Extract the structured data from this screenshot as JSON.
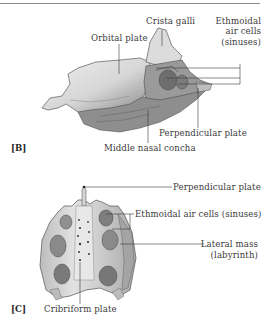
{
  "figure": {
    "panels": [
      {
        "tag": "[B]",
        "view": "lateral",
        "labels": {
          "crista_galli": "Crista galli",
          "orbital_plate": "Orbital plate",
          "ethmoidal_air_cells_1": "Ethmoidal",
          "ethmoidal_air_cells_2": "air cells",
          "ethmoidal_air_cells_3": "(sinuses)",
          "perpendicular_plate": "Perpendicular plate",
          "middle_nasal_concha": "Middle nasal concha"
        }
      },
      {
        "tag": "[C]",
        "view": "superior",
        "labels": {
          "perpendicular_plate": "Perpendicular plate",
          "ethmoidal_air_cells": "Ethmoidal air cells (sinuses)",
          "lateral_mass_1": "Lateral mass",
          "lateral_mass_2": "(labyrinth)",
          "cribriform_plate": "Cribriform plate"
        }
      }
    ],
    "colors": {
      "bone_light": "#e6e6e6",
      "bone_mid": "#b8b8b8",
      "bone_dark": "#6e6e6e",
      "leader_line": "#3a3a3a",
      "text": "#3c3c3c"
    }
  }
}
